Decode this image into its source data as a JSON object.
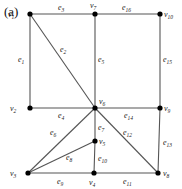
{
  "panel_label": "(a)",
  "vertices": [
    {
      "id": "v1",
      "label": "v1",
      "x": 30,
      "y": 14,
      "lx": 8,
      "ly": 17
    },
    {
      "id": "v7",
      "label": "v7",
      "x": 95,
      "y": 14,
      "lx": 90,
      "ly": 8
    },
    {
      "id": "v10",
      "label": "v10",
      "x": 160,
      "y": 14,
      "lx": 164,
      "ly": 17
    },
    {
      "id": "v2",
      "label": "v2",
      "x": 30,
      "y": 108,
      "lx": 10,
      "ly": 111
    },
    {
      "id": "v6",
      "label": "v6",
      "x": 95,
      "y": 108,
      "lx": 99,
      "ly": 104
    },
    {
      "id": "v9",
      "label": "v9",
      "x": 160,
      "y": 108,
      "lx": 164,
      "ly": 111
    },
    {
      "id": "v5",
      "label": "v5",
      "x": 95,
      "y": 141,
      "lx": 99,
      "ly": 144
    },
    {
      "id": "v3",
      "label": "v3",
      "x": 28,
      "y": 173,
      "lx": 10,
      "ly": 176
    },
    {
      "id": "v4",
      "label": "v4",
      "x": 94,
      "y": 173,
      "lx": 89,
      "ly": 185
    },
    {
      "id": "v8",
      "label": "v8",
      "x": 158,
      "y": 173,
      "lx": 163,
      "ly": 176
    }
  ],
  "edges": [
    {
      "label": "e1",
      "from": "v1",
      "to": "v2",
      "lx": 18,
      "ly": 62
    },
    {
      "label": "e2",
      "from": "v1",
      "to": "v6",
      "lx": 60,
      "ly": 52
    },
    {
      "label": "e3",
      "from": "v1",
      "to": "v7",
      "lx": 58,
      "ly": 10
    },
    {
      "label": "e4",
      "from": "v2",
      "to": "v6",
      "lx": 58,
      "ly": 118
    },
    {
      "label": "e5",
      "from": "v7",
      "to": "v6",
      "lx": 98,
      "ly": 62
    },
    {
      "label": "e6",
      "from": "v3",
      "to": "v6",
      "lx": 50,
      "ly": 135
    },
    {
      "label": "e7",
      "from": "v6",
      "to": "v5",
      "lx": 98,
      "ly": 130
    },
    {
      "label": "e8",
      "from": "v3",
      "to": "v5",
      "lx": 66,
      "ly": 160
    },
    {
      "label": "e9",
      "from": "v3",
      "to": "v4",
      "lx": 57,
      "ly": 184
    },
    {
      "label": "e10",
      "from": "v5",
      "to": "v4",
      "lx": 98,
      "ly": 161
    },
    {
      "label": "e11",
      "from": "v4",
      "to": "v8",
      "lx": 123,
      "ly": 184
    },
    {
      "label": "e12",
      "from": "v6",
      "to": "v8",
      "lx": 123,
      "ly": 135
    },
    {
      "label": "e13",
      "from": "v9",
      "to": "v8",
      "lx": 163,
      "ly": 145
    },
    {
      "label": "e14",
      "from": "v6",
      "to": "v9",
      "lx": 124,
      "ly": 118
    },
    {
      "label": "e15",
      "from": "v10",
      "to": "v9",
      "lx": 163,
      "ly": 62
    },
    {
      "label": "e16",
      "from": "v7",
      "to": "v10",
      "lx": 122,
      "ly": 10
    }
  ]
}
